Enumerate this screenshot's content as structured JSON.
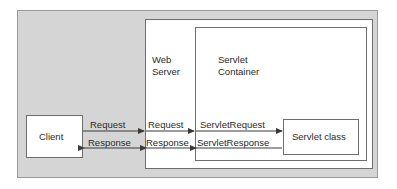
{
  "diagram": {
    "canvas": {
      "width": 397,
      "height": 189
    },
    "colors": {
      "enclosure_fill": "#d5d5d5",
      "enclosure_stroke": "#9a9a9a",
      "box_fill": "#ffffff",
      "box_stroke": "#6e6e6e",
      "text": "#2b2b2b",
      "arrow": "#3a3a3a"
    },
    "nodes": {
      "client": {
        "label": "Client"
      },
      "web_server": {
        "label": "Web\nServer",
        "line1": "Web",
        "line2": "Server"
      },
      "servlet_container": {
        "label": "Servlet\nContainer",
        "line1": "Servlet",
        "line2": "Container"
      },
      "servlet_class": {
        "label": "Servlet class"
      }
    },
    "flows": {
      "request": {
        "client_to_server": "Request",
        "server_inbound": "Request",
        "container_to_servlet": "ServletRequest"
      },
      "response": {
        "server_to_client": "Response",
        "server_outbound": "Response",
        "servlet_to_container": "ServletResponse"
      }
    }
  }
}
